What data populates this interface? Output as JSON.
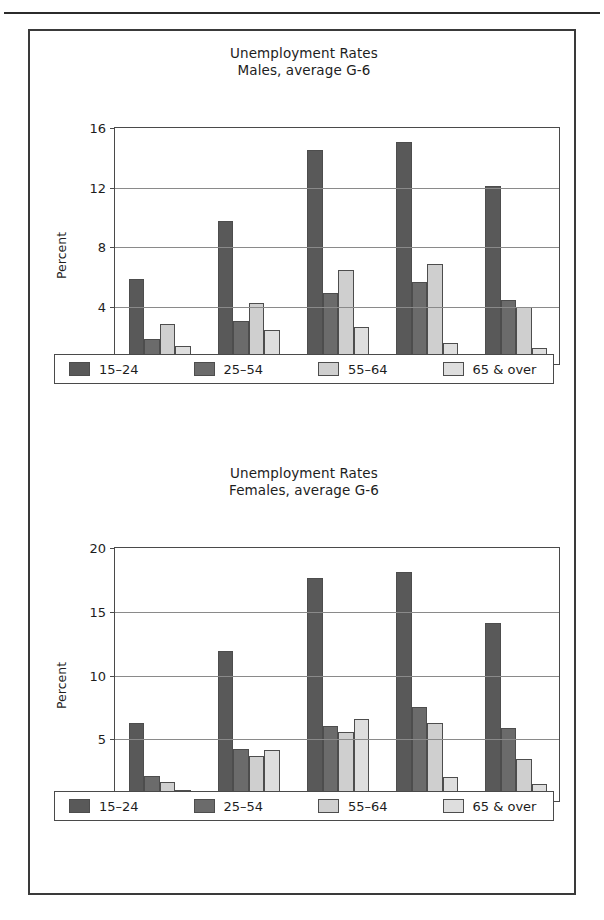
{
  "figure": {
    "panels": [
      {
        "id": "males",
        "title_line1": "Unemployment Rates",
        "title_line2": "Males, average G-6"
      },
      {
        "id": "females",
        "title_line1": "Unemployment Rates",
        "title_line2": "Females, average G-6"
      }
    ],
    "legend_items": [
      {
        "label": "15–24",
        "color": "#595959",
        "swatch_name": "legend-swatch-15-24"
      },
      {
        "label": "25–54",
        "color": "#6b6b6b",
        "swatch_name": "legend-swatch-25-54"
      },
      {
        "label": "55–64",
        "color": "#cfcfcf",
        "swatch_name": "legend-swatch-55-64"
      },
      {
        "label": "65 & over",
        "color": "#dedede",
        "swatch_name": "legend-swatch-65-over"
      }
    ]
  },
  "chart_data": [
    {
      "type": "bar",
      "title": "Unemployment Rates\nMales, average G-6",
      "panel": "Males, average G-6",
      "xlabel": "",
      "ylabel": "Percent",
      "ylim": [
        0,
        16
      ],
      "yticks": [
        0,
        4,
        8,
        12,
        16
      ],
      "ytick_labels": [
        "0",
        "4",
        "8",
        "12",
        "16"
      ],
      "grid": "horizontal",
      "legend_position": "below-axes",
      "categories": [
        "1972–74",
        "1975–79",
        "1980–84",
        "1985–89",
        "1990–91"
      ],
      "series": [
        {
          "name": "15–24",
          "color": "#595959",
          "values": [
            5.7,
            9.6,
            14.4,
            14.9,
            12.0
          ]
        },
        {
          "name": "25–54",
          "color": "#6b6b6b",
          "values": [
            1.7,
            2.9,
            4.8,
            5.5,
            4.3
          ]
        },
        {
          "name": "55–64",
          "color": "#cfcfcf",
          "values": [
            2.7,
            4.1,
            6.3,
            6.7,
            3.8
          ]
        },
        {
          "name": "65 & over",
          "color": "#dedede",
          "values": [
            1.2,
            2.3,
            2.5,
            1.4,
            1.1
          ]
        }
      ]
    },
    {
      "type": "bar",
      "title": "Unemployment Rates\nFemales, average G-6",
      "panel": "Females, average G-6",
      "xlabel": "",
      "ylabel": "Percent",
      "ylim": [
        0,
        20
      ],
      "yticks": [
        0,
        5,
        10,
        15,
        20
      ],
      "ytick_labels": [
        "0",
        "5",
        "10",
        "15",
        "20"
      ],
      "grid": "horizontal",
      "legend_position": "below-axes",
      "categories": [
        "1972–74",
        "1975–79",
        "1980–84",
        "1985–89",
        "1990–91"
      ],
      "series": [
        {
          "name": "15–24",
          "color": "#595959",
          "values": [
            6.1,
            11.8,
            17.5,
            18.0,
            14.0
          ]
        },
        {
          "name": "25–54",
          "color": "#6b6b6b",
          "values": [
            2.0,
            4.1,
            5.9,
            7.4,
            5.7
          ]
        },
        {
          "name": "55–64",
          "color": "#cfcfcf",
          "values": [
            1.5,
            3.5,
            5.4,
            6.1,
            3.3
          ]
        },
        {
          "name": "65 & over",
          "color": "#dedede",
          "values": [
            0.9,
            4.0,
            6.4,
            1.9,
            1.3
          ]
        }
      ]
    }
  ]
}
